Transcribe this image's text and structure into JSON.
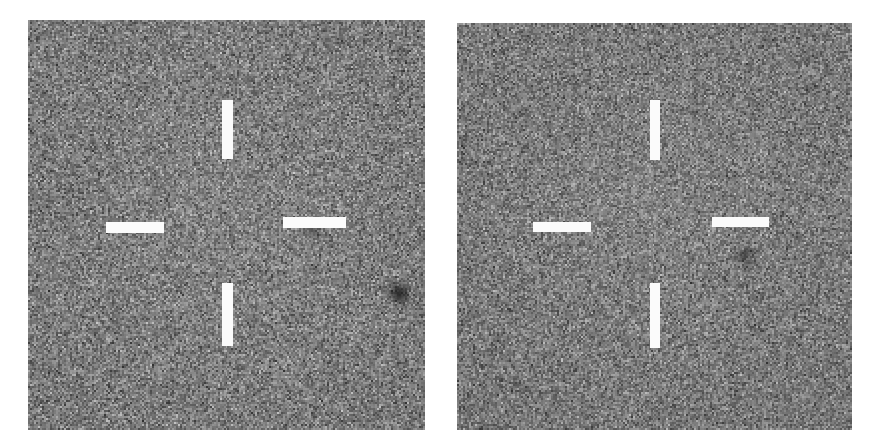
{
  "figure": {
    "type": "astronomical-image-pair",
    "background_color": "#ffffff",
    "width": 880,
    "height": 446
  },
  "panels": [
    {
      "id": "left-panel",
      "name": "left-cutout",
      "x": 28,
      "y": 20,
      "width": 397,
      "height": 410,
      "noise_seed": 1337,
      "noise_mean": 126,
      "noise_contrast": 52,
      "grain_px": 2,
      "crosshair": {
        "ticks": [
          {
            "name": "tick-top",
            "orientation": "vertical",
            "x": 222,
            "y": 100,
            "w": 11,
            "h": 59
          },
          {
            "name": "tick-bottom",
            "orientation": "vertical",
            "x": 222,
            "y": 283,
            "w": 11,
            "h": 63
          },
          {
            "name": "tick-left",
            "orientation": "horizontal",
            "x": 106,
            "y": 222,
            "w": 58,
            "h": 11
          },
          {
            "name": "tick-right",
            "orientation": "horizontal",
            "x": 283,
            "y": 217,
            "w": 63,
            "h": 11
          }
        ],
        "color": "#fbfbfb"
      },
      "sources": [
        {
          "name": "faint-source",
          "x": 313,
          "y": 229,
          "r": 11,
          "darkness": 0.46,
          "blur": 5
        },
        {
          "name": "bright-dark-source",
          "x": 399,
          "y": 293,
          "r": 12,
          "darkness": 0.86,
          "blur": 3
        },
        {
          "name": "corner-speck",
          "x": 342,
          "y": 39,
          "r": 6,
          "darkness": 0.5,
          "blur": 3
        }
      ]
    },
    {
      "id": "right-panel",
      "name": "right-cutout",
      "x": 457,
      "y": 23,
      "width": 395,
      "height": 407,
      "noise_seed": 90210,
      "noise_mean": 124,
      "noise_contrast": 50,
      "grain_px": 2,
      "crosshair": {
        "ticks": [
          {
            "name": "tick-top",
            "orientation": "vertical",
            "x": 650,
            "y": 100,
            "w": 10,
            "h": 60
          },
          {
            "name": "tick-bottom",
            "orientation": "vertical",
            "x": 650,
            "y": 283,
            "w": 10,
            "h": 65
          },
          {
            "name": "tick-left",
            "orientation": "horizontal",
            "x": 533,
            "y": 222,
            "w": 58,
            "h": 10
          },
          {
            "name": "tick-right",
            "orientation": "horizontal",
            "x": 712,
            "y": 217,
            "w": 57,
            "h": 10
          }
        ],
        "color": "#fbfbfb"
      },
      "sources": [
        {
          "name": "central-source",
          "x": 746,
          "y": 256,
          "r": 10,
          "darkness": 0.72,
          "blur": 4
        },
        {
          "name": "corner-speck",
          "x": 766,
          "y": 40,
          "r": 5,
          "darkness": 0.45,
          "blur": 3
        }
      ]
    }
  ]
}
